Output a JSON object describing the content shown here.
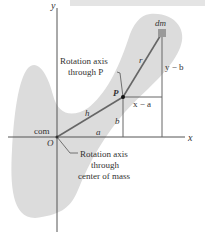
{
  "figure": {
    "axes": {
      "x_label": "x",
      "y_label": "y"
    },
    "points": {
      "origin_label": "O",
      "com_label": "com",
      "point_p_label": "P",
      "mass_element_label": "dm"
    },
    "segments": {
      "h": "h",
      "r": "r",
      "a": "a",
      "b": "b",
      "x_minus_a": "x − a",
      "y_minus_b": "y − b"
    },
    "annotations": {
      "axis_p_line1": "Rotation axis",
      "axis_p_line2": "through P",
      "axis_com_line1": "Rotation axis",
      "axis_com_line2": "through",
      "axis_com_line3": "center of mass"
    },
    "colors": {
      "body_fill": "#dcdcdc",
      "line": "#555555",
      "dm_square": "#9a9a9a",
      "top_band": "#e4e4e4"
    }
  }
}
